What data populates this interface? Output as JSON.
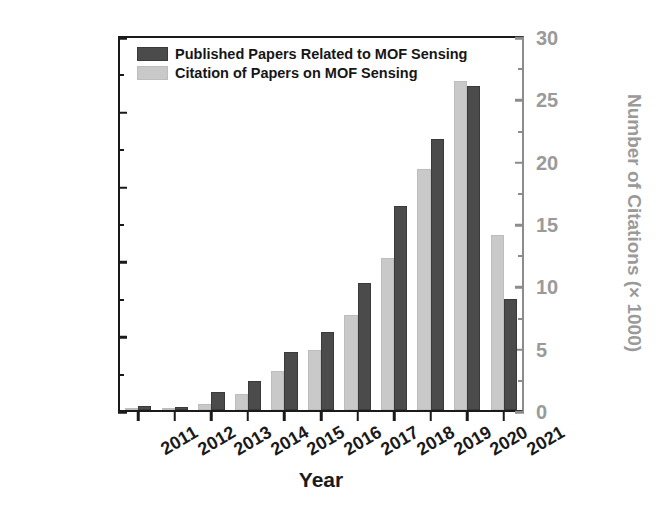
{
  "chart_data": {
    "type": "bar",
    "title": "",
    "xlabel": "Year",
    "ylabel": "Number of Published Papers",
    "y2label": "Number of Citations (× 1000)",
    "categories": [
      "2011",
      "2012",
      "2013",
      "2014",
      "2015",
      "2016",
      "2017",
      "2018",
      "2019",
      "2020",
      "2021"
    ],
    "series": [
      {
        "name": "Published Papers Related to MOF Sensing",
        "axis": "left",
        "color": "#4b4b4b",
        "values": [
          10,
          8,
          48,
          78,
          155,
          208,
          340,
          545,
          725,
          866,
          298
        ]
      },
      {
        "name": "Citation of Papers on MOF Sensing",
        "axis": "right",
        "color": "#c9c9c9",
        "values": [
          0.1,
          0.2,
          0.5,
          1.3,
          3.1,
          4.8,
          7.6,
          12.2,
          19.3,
          26.4,
          14.0
        ]
      }
    ],
    "ylim": [
      0,
      1000
    ],
    "y2lim": [
      0,
      30
    ],
    "yticks": [
      "0",
      "200",
      "400",
      "600",
      "800",
      "1000"
    ],
    "y2ticks": [
      "0",
      "5",
      "10",
      "15",
      "20",
      "25",
      "30"
    ],
    "grid": false,
    "legend_position": "top-left"
  },
  "legend": {
    "items": [
      {
        "label": "Published Papers Related to MOF Sensing",
        "swatch": "dark"
      },
      {
        "label": "Citation of Papers on MOF Sensing",
        "swatch": "light"
      }
    ]
  },
  "colors": {
    "left_axis": "#1a1a1a",
    "right_axis": "#9a9a9a",
    "bar_dark": "#4b4b4b",
    "bar_light": "#c9c9c9"
  }
}
